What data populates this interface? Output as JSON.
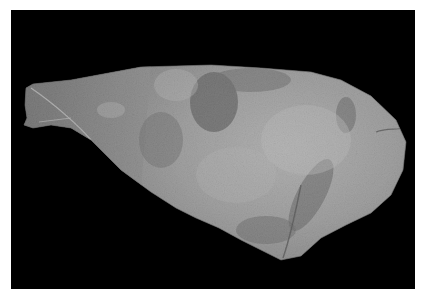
{
  "image": {
    "kind": "photograph",
    "description": "Grayscale photograph of an elongated, club-shaped organic specimen with a mottled, textured surface lying on a black background, framed by a thin white border",
    "subject": "specimen",
    "colors": {
      "border": "#ffffff",
      "background": "#000000",
      "specimen_light": "#d8d8d8",
      "specimen_mid": "#8a8a8a",
      "specimen_dark": "#3a3a3a"
    }
  }
}
